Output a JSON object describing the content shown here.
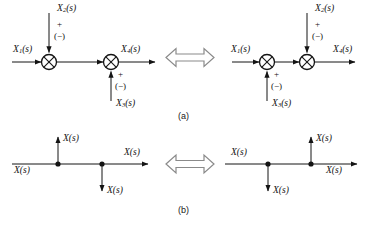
{
  "figure": {
    "type": "block-diagram",
    "colors": {
      "line": "#141414",
      "text": "#141414",
      "equiv_arrow_stroke": "#8a8a8a",
      "equiv_arrow_fill": "#ffffff",
      "background": "#ffffff"
    },
    "captions": {
      "part_a": "(a)",
      "part_b": "(b)"
    },
    "part_a": {
      "caption": "(a)",
      "equivalence_symbol": "double-headed-arrow",
      "left_diagram": {
        "name": "summing-junctions-order-1",
        "input_label": "X1(s)",
        "input_base": "X",
        "input_sub": "1",
        "input_tail": "(s)",
        "junction1": {
          "name": "summing-junction-1",
          "top_input_base": "X",
          "top_input_sub": "2",
          "top_input_tail": "(s)",
          "sign_plus": "+",
          "sign_minus": "(−)"
        },
        "junction2": {
          "name": "summing-junction-2",
          "bottom_input_base": "X",
          "bottom_input_sub": "3",
          "bottom_input_tail": "(s)",
          "sign_plus": "+",
          "sign_minus": "(−)"
        },
        "output_base": "X",
        "output_sub": "4",
        "output_tail": "(s)"
      },
      "right_diagram": {
        "name": "summing-junctions-order-2",
        "input_label": "X1(s)",
        "input_base": "X",
        "input_sub": "1",
        "input_tail": "(s)",
        "junction1": {
          "name": "summing-junction-1",
          "bottom_input_base": "X",
          "bottom_input_sub": "3",
          "bottom_input_tail": "(s)",
          "sign_plus": "+",
          "sign_minus": "(−)"
        },
        "junction2": {
          "name": "summing-junction-2",
          "top_input_base": "X",
          "top_input_sub": "2",
          "top_input_tail": "(s)",
          "sign_plus": "+",
          "sign_minus": "(−)"
        },
        "output_base": "X",
        "output_sub": "4",
        "output_tail": "(s)"
      }
    },
    "part_b": {
      "caption": "(b)",
      "equivalence_symbol": "double-headed-arrow",
      "left_diagram": {
        "name": "pickoff-points-order-1",
        "input_label": "X(s)",
        "branch_up_label": "X(s)",
        "branch_down_label": "X(s)",
        "output_label": "X(s)"
      },
      "right_diagram": {
        "name": "pickoff-points-order-2",
        "input_label": "X(s)",
        "branch_down_label": "X(s)",
        "branch_up_label": "X(s)",
        "output_label": "X(s)"
      }
    }
  }
}
